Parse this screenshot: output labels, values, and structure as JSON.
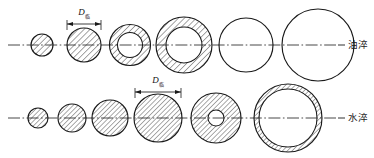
{
  "figure": {
    "background": "#ffffff",
    "stroke_color": "#1a1a1a",
    "hatch_color": "#2b2b2b",
    "width": 374,
    "height": 158
  },
  "rows": [
    {
      "id": "oil-quench",
      "label": "油淬",
      "label_dash": "—",
      "axis_y": 45,
      "axis_x1": 8,
      "axis_x2": 336,
      "dimension": {
        "label_main": "D",
        "label_sub": "临",
        "label_x": 84,
        "label_y": 15,
        "line_y": 24,
        "x1": 67,
        "x2": 101,
        "ext_top": 20,
        "ext_bottom": 30
      },
      "circles": [
        {
          "name": "section-1",
          "cx": 42,
          "r_outer": 11,
          "r_inner": 0,
          "fill": "hatch"
        },
        {
          "name": "section-2",
          "cx": 84,
          "r_outer": 17,
          "r_inner": 0,
          "fill": "hatch"
        },
        {
          "name": "section-3",
          "cx": 130,
          "r_outer": 20.5,
          "r_inner": 12.5,
          "fill": "ring"
        },
        {
          "name": "section-4",
          "cx": 184,
          "r_outer": 28,
          "r_inner": 18,
          "fill": "ring"
        },
        {
          "name": "section-5",
          "cx": 246,
          "r_outer": 27,
          "r_inner": 0,
          "fill": "none"
        },
        {
          "name": "section-6",
          "cx": 318,
          "r_outer": 36,
          "r_inner": 0,
          "fill": "none"
        }
      ]
    },
    {
      "id": "water-quench",
      "label": "水淬",
      "label_dash": "—",
      "axis_y": 118,
      "axis_x1": 8,
      "axis_x2": 336,
      "dimension": {
        "label_main": "D",
        "label_sub": "临",
        "label_x": 158,
        "label_y": 83,
        "line_y": 92,
        "x1": 135,
        "x2": 181,
        "ext_top": 88,
        "ext_bottom": 98
      },
      "circles": [
        {
          "name": "section-1",
          "cx": 38,
          "r_outer": 10,
          "r_inner": 0,
          "fill": "hatch"
        },
        {
          "name": "section-2",
          "cx": 72,
          "r_outer": 14,
          "r_inner": 0,
          "fill": "hatch"
        },
        {
          "name": "section-3",
          "cx": 110,
          "r_outer": 18,
          "r_inner": 0,
          "fill": "hatch"
        },
        {
          "name": "section-4",
          "cx": 158,
          "r_outer": 24,
          "r_inner": 0,
          "fill": "hatch"
        },
        {
          "name": "section-5",
          "cx": 216,
          "r_outer": 25,
          "r_inner": 8,
          "fill": "ring"
        },
        {
          "name": "section-6",
          "cx": 288,
          "r_outer": 34,
          "r_inner": 29,
          "fill": "ring"
        }
      ]
    }
  ]
}
